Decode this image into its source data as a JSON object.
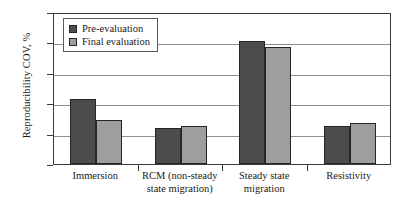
{
  "chart_data": {
    "type": "bar",
    "title": "",
    "xlabel": "",
    "ylabel": "Reproducibility COV, %",
    "ylim": [
      0,
      100
    ],
    "yticks": [
      0,
      20,
      40,
      60,
      80,
      100
    ],
    "ytick_labels": [
      "0",
      "20",
      "40",
      "60",
      "80",
      "100"
    ],
    "grid": true,
    "legend_position": "top-left",
    "categories": [
      "Immersion",
      "RCM (non-steady state migration)",
      "Steady state migration",
      "Resistivity"
    ],
    "category_lines": [
      [
        "Immersion"
      ],
      [
        "RCM (non-steady",
        "state migration)"
      ],
      [
        "Steady state",
        "migration"
      ],
      [
        "Resistivity"
      ]
    ],
    "series": [
      {
        "name": "Pre-evaluation",
        "color": "#4c4c4c",
        "values": [
          43,
          24,
          81,
          25
        ]
      },
      {
        "name": "Final evaluation",
        "color": "#9e9e9e",
        "values": [
          29,
          25,
          77,
          27
        ]
      }
    ]
  }
}
